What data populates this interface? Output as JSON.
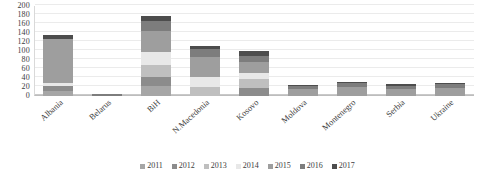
{
  "chart_data": {
    "type": "bar",
    "stacked": true,
    "title": "",
    "xlabel": "",
    "ylabel": "",
    "ylim": [
      0,
      200
    ],
    "ytick_step": 20,
    "yticks": [
      200,
      180,
      160,
      140,
      120,
      100,
      80,
      60,
      40,
      20,
      0
    ],
    "grid": true,
    "legend_position": "bottom",
    "categories": [
      "Albania",
      "Belarus",
      "BiH",
      "N.Macedonia",
      "Kosovo",
      "Moldova",
      "Montenegro",
      "Serbia",
      "Ukraine"
    ],
    "series": [
      {
        "name": "2011",
        "color": "#a6a6a6",
        "values": [
          12,
          0,
          22,
          0,
          0,
          0,
          0,
          0,
          0
        ]
      },
      {
        "name": "2012",
        "color": "#8c8c8c",
        "values": [
          10,
          0,
          20,
          0,
          18,
          0,
          0,
          0,
          0
        ]
      },
      {
        "name": "2013",
        "color": "#bfbfbf",
        "values": [
          0,
          0,
          26,
          20,
          20,
          0,
          0,
          0,
          0
        ]
      },
      {
        "name": "2014",
        "color": "#e8e8e8",
        "values": [
          8,
          0,
          30,
          22,
          14,
          0,
          0,
          0,
          0
        ]
      },
      {
        "name": "2015",
        "color": "#9e9e9e",
        "values": [
          96,
          0,
          46,
          44,
          24,
          16,
          20,
          16,
          18
        ]
      },
      {
        "name": "2016",
        "color": "#7d7d7d",
        "values": [
          0,
          4,
          22,
          18,
          14,
          6,
          8,
          7,
          8
        ]
      },
      {
        "name": "2017",
        "color": "#4d4d4d",
        "values": [
          9,
          0,
          12,
          8,
          10,
          3,
          4,
          4,
          4
        ]
      }
    ],
    "totals": [
      135,
      4,
      178,
      112,
      100,
      25,
      32,
      27,
      30
    ]
  },
  "legend": {
    "items": [
      {
        "label": "2011"
      },
      {
        "label": "2012"
      },
      {
        "label": "2013"
      },
      {
        "label": "2014"
      },
      {
        "label": "2015"
      },
      {
        "label": "2016"
      },
      {
        "label": "2017"
      }
    ]
  }
}
